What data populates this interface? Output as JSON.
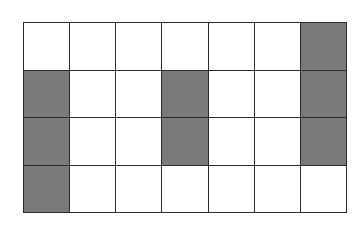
{
  "grid": {
    "rows": 4,
    "cols": 7,
    "shaded_color": "#7a7a7a",
    "empty_color": "#ffffff",
    "line_color": "#2a2a2a",
    "cells": [
      [
        0,
        0,
        0,
        0,
        0,
        0,
        1
      ],
      [
        1,
        0,
        0,
        1,
        0,
        0,
        1
      ],
      [
        1,
        0,
        0,
        1,
        0,
        0,
        1
      ],
      [
        1,
        0,
        0,
        0,
        0,
        0,
        0
      ]
    ],
    "shaded_count": 8,
    "total_cells": 28
  }
}
